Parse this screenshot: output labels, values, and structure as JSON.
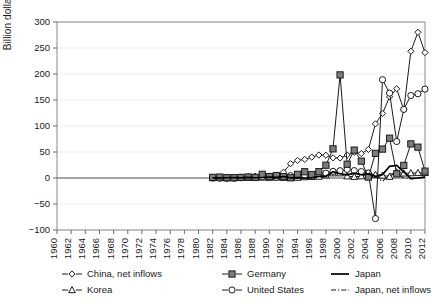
{
  "chart_data": {
    "type": "line",
    "title": "",
    "xlabel": "",
    "ylabel": "Billion dollars",
    "ylim": [
      -100,
      300
    ],
    "ytick_step": 50,
    "yticks": [
      -100,
      -50,
      0,
      50,
      100,
      150,
      200,
      250,
      300
    ],
    "xlim": [
      1960,
      2012
    ],
    "xticks": [
      1960,
      1962,
      1964,
      1966,
      1968,
      1970,
      1972,
      1974,
      1976,
      1978,
      1980,
      1982,
      1984,
      1986,
      1988,
      1990,
      1992,
      1994,
      1996,
      1998,
      2000,
      2002,
      2004,
      2006,
      2008,
      2010,
      2012
    ],
    "grid": "horizontal",
    "legend_position": "bottom",
    "series": [
      {
        "name": "China, net inflows",
        "marker": "open-diamond",
        "linestyle": "solid",
        "x": [
          1982,
          1983,
          1984,
          1985,
          1986,
          1987,
          1988,
          1989,
          1990,
          1991,
          1992,
          1993,
          1994,
          1995,
          1996,
          1997,
          1998,
          1999,
          2000,
          2001,
          2002,
          2003,
          2004,
          2005,
          2006,
          2007,
          2008,
          2009,
          2010,
          2011,
          2012
        ],
        "values": [
          0.4,
          0.6,
          1.3,
          1.7,
          1.9,
          2.3,
          3.2,
          3.4,
          3.5,
          4.4,
          11.2,
          27.5,
          33.8,
          35.8,
          40.2,
          44.2,
          43.8,
          38.8,
          38.4,
          44.2,
          49.3,
          47.1,
          54.9,
          104.1,
          124.1,
          156.2,
          171.5,
          131.1,
          243.7,
          280.1,
          241.2
        ]
      },
      {
        "name": "Germany",
        "marker": "filled-square",
        "linestyle": "solid",
        "x": [
          1982,
          1983,
          1984,
          1985,
          1986,
          1987,
          1988,
          1989,
          1990,
          1991,
          1992,
          1993,
          1994,
          1995,
          1996,
          1997,
          1998,
          1999,
          2000,
          2001,
          2002,
          2003,
          2004,
          2005,
          2006,
          2007,
          2008,
          2009,
          2010,
          2011,
          2012
        ],
        "values": [
          1.2,
          1.8,
          0.6,
          0.6,
          1.1,
          1.9,
          1.2,
          7.1,
          2.7,
          4.7,
          2.5,
          0.4,
          7.1,
          12.0,
          6.6,
          12.2,
          24.6,
          56.1,
          198.3,
          26.4,
          53.6,
          32.4,
          1.8,
          47.4,
          55.6,
          76.5,
          8.1,
          24.2,
          65.6,
          59.3,
          13.2
        ]
      },
      {
        "name": "Japan",
        "marker": "none",
        "linestyle": "solid-thick",
        "x": [
          1982,
          1983,
          1984,
          1985,
          1986,
          1987,
          1988,
          1989,
          1990,
          1991,
          1992,
          1993,
          1994,
          1995,
          1996,
          1997,
          1998,
          1999,
          2000,
          2001,
          2002,
          2003,
          2004,
          2005,
          2006,
          2007,
          2008,
          2009,
          2010,
          2011,
          2012
        ],
        "values": [
          0.4,
          0.4,
          0.5,
          0.6,
          0.2,
          1.2,
          0.5,
          1.0,
          1.8,
          1.4,
          2.8,
          0.2,
          0.9,
          0.0,
          0.2,
          3.2,
          3.3,
          12.3,
          8.2,
          6.2,
          9.2,
          6.3,
          7.8,
          3.2,
          6.5,
          22.5,
          24.4,
          11.9,
          -1.3,
          0.0,
          1.7
        ]
      },
      {
        "name": "Korea",
        "marker": "open-triangle",
        "linestyle": "solid",
        "x": [
          1982,
          1983,
          1984,
          1985,
          1986,
          1987,
          1988,
          1989,
          1990,
          1991,
          1992,
          1993,
          1994,
          1995,
          1996,
          1997,
          1998,
          1999,
          2000,
          2001,
          2002,
          2003,
          2004,
          2005,
          2006,
          2007,
          2008,
          2009,
          2010,
          2011,
          2012
        ],
        "values": [
          0.1,
          0.1,
          0.1,
          0.2,
          0.4,
          0.6,
          0.9,
          1.1,
          0.8,
          1.2,
          0.7,
          0.6,
          0.8,
          1.8,
          2.3,
          2.8,
          5.4,
          9.3,
          9.3,
          3.5,
          2.4,
          3.5,
          9.2,
          6.3,
          4.9,
          2.6,
          11.2,
          9.0,
          9.5,
          9.8,
          9.9
        ]
      },
      {
        "name": "United States",
        "marker": "open-circle",
        "linestyle": "solid",
        "x": [
          1982,
          1983,
          1984,
          1985,
          1986,
          1987,
          1988,
          1989,
          1990,
          1991,
          1992,
          1993,
          1994,
          1995,
          1996,
          1997,
          1998,
          1999,
          2000,
          2001,
          2002,
          2003,
          2004,
          2005,
          2006,
          2007,
          2008,
          2009,
          2010,
          2011,
          2012
        ],
        "values": [
          -0.2,
          -0.5,
          -0.7,
          -0.4,
          0.6,
          1.4,
          1.8,
          2.5,
          1.6,
          1.2,
          2.2,
          4.5,
          4.3,
          5.2,
          6.3,
          8.4,
          9.3,
          12.8,
          14.0,
          16.5,
          14.2,
          12.4,
          9.6,
          -78.0,
          189.0,
          163.2,
          70.2,
          132.0,
          158.6,
          162.0,
          171.0
        ]
      },
      {
        "name": "Japan, net inflows",
        "marker": "none",
        "linestyle": "dashdot",
        "x": [
          1982,
          1983,
          1984,
          1985,
          1986,
          1987,
          1988,
          1989,
          1990,
          1991,
          1992,
          1993,
          1994,
          1995,
          1996,
          1997,
          1998,
          1999,
          2000,
          2001,
          2002,
          2003,
          2004,
          2005,
          2006,
          2007,
          2008,
          2009,
          2010,
          2011,
          2012
        ],
        "values": [
          0.4,
          0.4,
          0.0,
          0.6,
          0.2,
          1.2,
          0.5,
          -1.0,
          1.8,
          1.4,
          2.8,
          0.2,
          0.9,
          0.0,
          0.2,
          3.2,
          3.3,
          12.3,
          8.2,
          6.2,
          9.2,
          6.3,
          7.8,
          3.2,
          -6.5,
          8.0,
          8.0,
          0.0,
          -1.3,
          0.0,
          1.7
        ]
      }
    ],
    "legend": [
      {
        "label": "China, net inflows",
        "marker": "open-diamond",
        "linestyle": "solid"
      },
      {
        "label": "Germany",
        "marker": "filled-square",
        "linestyle": "solid"
      },
      {
        "label": "Japan",
        "marker": "none",
        "linestyle": "solid-thick"
      },
      {
        "label": "Korea",
        "marker": "open-triangle",
        "linestyle": "solid"
      },
      {
        "label": "United States",
        "marker": "open-circle",
        "linestyle": "solid"
      },
      {
        "label": "Japan, net inflows",
        "marker": "none",
        "linestyle": "dashdot"
      }
    ]
  },
  "colors": {
    "line": "#1a1a1a",
    "marker_fill_open": "#ffffff",
    "marker_fill_solid": "#7d7d7d",
    "grid": "#e8e8e8",
    "axis": "#6b6b6b",
    "background": "#ffffff"
  }
}
